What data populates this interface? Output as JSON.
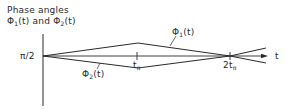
{
  "diagram": {
    "title_line1": "Phase angles",
    "title_line2_part1": "Φ",
    "title_line2_sub1": "1",
    "title_line2_part2": "(t) and Φ",
    "title_line2_sub2": "2",
    "title_line2_part3": "(t)",
    "y_tick_label": "π/2",
    "x_axis_label": "t",
    "tick1_label": "t",
    "tick1_sub": "π",
    "tick2_label": "2t",
    "tick2_sub": "π",
    "curve1_label": "Φ",
    "curve1_sub": "1",
    "curve1_suffix": "(t)",
    "curve2_label": "Φ",
    "curve2_sub": "2",
    "curve2_suffix": "(t)",
    "line_color": "#2a2a2a",
    "background": "#ffffff"
  }
}
